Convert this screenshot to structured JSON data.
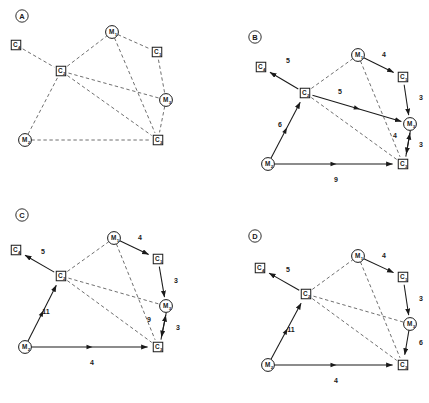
{
  "figure": {
    "caption": "",
    "width": 429,
    "height": 403,
    "colors": {
      "ink": "#1a1a1a",
      "background": "#ffffff",
      "dashed_edge": "#4a4a4a",
      "solid_edge": "#1a1a1a"
    },
    "legend_shapes": {
      "square": "C nodes drawn as squares",
      "circle": "M nodes drawn as circles"
    }
  },
  "panels": [
    {
      "id": "A",
      "letter": "A",
      "letter_pos": {
        "x": 22,
        "y": 16
      },
      "origin": {
        "x": 0,
        "y": 0
      },
      "nodes": [
        {
          "id": "C4",
          "label": "C",
          "sub": "4",
          "shape": "square",
          "x": 16,
          "y": 45
        },
        {
          "id": "C2",
          "label": "C",
          "sub": "2",
          "shape": "square",
          "x": 61,
          "y": 71
        },
        {
          "id": "M1",
          "label": "M",
          "sub": "1",
          "shape": "circle",
          "x": 112,
          "y": 32
        },
        {
          "id": "C1",
          "label": "C",
          "sub": "1",
          "shape": "square",
          "x": 157,
          "y": 52
        },
        {
          "id": "M3",
          "label": "M",
          "sub": "3",
          "shape": "circle",
          "x": 166,
          "y": 100
        },
        {
          "id": "C3",
          "label": "C",
          "sub": "3",
          "shape": "square",
          "x": 158,
          "y": 140
        },
        {
          "id": "M2",
          "label": "M",
          "sub": "2",
          "shape": "circle",
          "x": 25,
          "y": 140
        }
      ],
      "edges": [
        {
          "from": "C4",
          "to": "C2",
          "style": "dashed",
          "arrow": false,
          "weight": null
        },
        {
          "from": "C2",
          "to": "M1",
          "style": "dashed",
          "arrow": false,
          "weight": null
        },
        {
          "from": "M1",
          "to": "C1",
          "style": "dashed",
          "arrow": false,
          "weight": null
        },
        {
          "from": "C1",
          "to": "M3",
          "style": "dashed",
          "arrow": false,
          "weight": null
        },
        {
          "from": "C2",
          "to": "M3",
          "style": "dashed",
          "arrow": false,
          "weight": null
        },
        {
          "from": "C2",
          "to": "C3",
          "style": "dashed",
          "arrow": false,
          "weight": null
        },
        {
          "from": "M1",
          "to": "C3",
          "style": "dashed",
          "arrow": false,
          "weight": null
        },
        {
          "from": "M3",
          "to": "C3",
          "style": "dashed",
          "arrow": false,
          "weight": null
        },
        {
          "from": "C2",
          "to": "M2",
          "style": "dashed",
          "arrow": false,
          "weight": null
        },
        {
          "from": "M2",
          "to": "C3",
          "style": "dashed",
          "arrow": false,
          "weight": null
        }
      ],
      "weight_labels": []
    },
    {
      "id": "B",
      "letter": "B",
      "letter_pos": {
        "x": 255,
        "y": 37
      },
      "origin": {
        "x": 215,
        "y": 0
      },
      "nodes": [
        {
          "id": "C4",
          "label": "C",
          "sub": "4",
          "shape": "square",
          "x": 261,
          "y": 67
        },
        {
          "id": "C2",
          "label": "C",
          "sub": "2",
          "shape": "square",
          "x": 305,
          "y": 93
        },
        {
          "id": "M1",
          "label": "M",
          "sub": "1",
          "shape": "circle",
          "x": 358,
          "y": 55
        },
        {
          "id": "C1",
          "label": "C",
          "sub": "1",
          "shape": "square",
          "x": 403,
          "y": 77
        },
        {
          "id": "M3",
          "label": "M",
          "sub": "3",
          "shape": "circle",
          "x": 410,
          "y": 124
        },
        {
          "id": "C3",
          "label": "C",
          "sub": "3",
          "shape": "square",
          "x": 403,
          "y": 164
        },
        {
          "id": "M2",
          "label": "M",
          "sub": "2",
          "shape": "circle",
          "x": 268,
          "y": 164
        }
      ],
      "edges": [
        {
          "from": "C2",
          "to": "C4",
          "style": "solid",
          "arrow": true,
          "weight": "5"
        },
        {
          "from": "C2",
          "to": "M1",
          "style": "dashed",
          "arrow": false,
          "weight": null
        },
        {
          "from": "M1",
          "to": "C1",
          "style": "solid",
          "arrow": true,
          "weight": "4"
        },
        {
          "from": "C1",
          "to": "M3",
          "style": "solid",
          "arrow": true,
          "weight": "3"
        },
        {
          "from": "C2",
          "to": "M3",
          "style": "solid",
          "arrow": true,
          "weight": "5"
        },
        {
          "from": "C2",
          "to": "C3",
          "style": "dashed",
          "arrow": false,
          "weight": null
        },
        {
          "from": "M1",
          "to": "C3",
          "style": "dashed",
          "arrow": false,
          "weight": null
        },
        {
          "from": "M3",
          "to": "C3",
          "style": "solid",
          "arrow": true,
          "weight": "3"
        },
        {
          "from": "C3",
          "to": "M3",
          "style": "solid",
          "arrow": true,
          "weight": "4"
        },
        {
          "from": "M2",
          "to": "C2",
          "style": "solid",
          "arrow": true,
          "weight": "6"
        },
        {
          "from": "M2",
          "to": "C3",
          "style": "solid",
          "arrow": true,
          "weight": "9"
        }
      ],
      "weight_labels": [
        {
          "text": "5",
          "x": 288,
          "y": 63
        },
        {
          "text": "4",
          "x": 384,
          "y": 57
        },
        {
          "text": "3",
          "x": 421,
          "y": 100
        },
        {
          "text": "5",
          "x": 340,
          "y": 94
        },
        {
          "text": "4",
          "x": 395,
          "y": 138
        },
        {
          "text": "3",
          "x": 421,
          "y": 147
        },
        {
          "text": "6",
          "x": 280,
          "y": 127
        },
        {
          "text": "9",
          "x": 336,
          "y": 182
        }
      ]
    },
    {
      "id": "C",
      "letter": "C",
      "letter_pos": {
        "x": 22,
        "y": 215
      },
      "origin": {
        "x": 0,
        "y": 200
      },
      "nodes": [
        {
          "id": "C4",
          "label": "C",
          "sub": "4",
          "shape": "square",
          "x": 16,
          "y": 250
        },
        {
          "id": "C2",
          "label": "C",
          "sub": "2",
          "shape": "square",
          "x": 61,
          "y": 276
        },
        {
          "id": "M1",
          "label": "M",
          "sub": "1",
          "shape": "circle",
          "x": 114,
          "y": 238
        },
        {
          "id": "C1",
          "label": "C",
          "sub": "1",
          "shape": "square",
          "x": 158,
          "y": 259
        },
        {
          "id": "M3",
          "label": "M",
          "sub": "3",
          "shape": "circle",
          "x": 166,
          "y": 306
        },
        {
          "id": "C3",
          "label": "C",
          "sub": "3",
          "shape": "square",
          "x": 158,
          "y": 347
        },
        {
          "id": "M2",
          "label": "M",
          "sub": "2",
          "shape": "circle",
          "x": 25,
          "y": 347
        }
      ],
      "edges": [
        {
          "from": "C2",
          "to": "C4",
          "style": "solid",
          "arrow": true,
          "weight": "5"
        },
        {
          "from": "C2",
          "to": "M1",
          "style": "dashed",
          "arrow": false,
          "weight": null
        },
        {
          "from": "M1",
          "to": "C1",
          "style": "solid",
          "arrow": true,
          "weight": "4"
        },
        {
          "from": "C1",
          "to": "M3",
          "style": "solid",
          "arrow": true,
          "weight": "3"
        },
        {
          "from": "C2",
          "to": "M3",
          "style": "dashed",
          "arrow": false,
          "weight": null
        },
        {
          "from": "C2",
          "to": "C3",
          "style": "dashed",
          "arrow": false,
          "weight": null
        },
        {
          "from": "M1",
          "to": "C3",
          "style": "dashed",
          "arrow": false,
          "weight": null
        },
        {
          "from": "M3",
          "to": "C3",
          "style": "solid",
          "arrow": true,
          "weight": "3"
        },
        {
          "from": "C3",
          "to": "M3",
          "style": "solid",
          "arrow": true,
          "weight": "9"
        },
        {
          "from": "M2",
          "to": "C2",
          "style": "solid",
          "arrow": true,
          "weight": "11"
        },
        {
          "from": "M2",
          "to": "C3",
          "style": "solid",
          "arrow": true,
          "weight": "4"
        }
      ],
      "weight_labels": [
        {
          "text": "5",
          "x": 43,
          "y": 254
        },
        {
          "text": "4",
          "x": 140,
          "y": 240
        },
        {
          "text": "3",
          "x": 176,
          "y": 283
        },
        {
          "text": "9",
          "x": 149,
          "y": 322
        },
        {
          "text": "3",
          "x": 178,
          "y": 330
        },
        {
          "text": "11",
          "x": 46,
          "y": 314
        },
        {
          "text": "4",
          "x": 92,
          "y": 365
        }
      ]
    },
    {
      "id": "D",
      "letter": "D",
      "letter_pos": {
        "x": 255,
        "y": 236
      },
      "origin": {
        "x": 215,
        "y": 200
      },
      "nodes": [
        {
          "id": "C4",
          "label": "C",
          "sub": "4",
          "shape": "square",
          "x": 260,
          "y": 268
        },
        {
          "id": "C2",
          "label": "C",
          "sub": "2",
          "shape": "square",
          "x": 306,
          "y": 294
        },
        {
          "id": "M1",
          "label": "M",
          "sub": "1",
          "shape": "circle",
          "x": 358,
          "y": 256
        },
        {
          "id": "C1",
          "label": "C",
          "sub": "1",
          "shape": "square",
          "x": 403,
          "y": 277
        },
        {
          "id": "M3",
          "label": "M",
          "sub": "3",
          "shape": "circle",
          "x": 410,
          "y": 324
        },
        {
          "id": "C3",
          "label": "C",
          "sub": "3",
          "shape": "square",
          "x": 403,
          "y": 365
        },
        {
          "id": "M2",
          "label": "M",
          "sub": "2",
          "shape": "circle",
          "x": 268,
          "y": 365
        }
      ],
      "edges": [
        {
          "from": "C2",
          "to": "C4",
          "style": "solid",
          "arrow": true,
          "weight": "5"
        },
        {
          "from": "C2",
          "to": "M1",
          "style": "dashed",
          "arrow": false,
          "weight": null
        },
        {
          "from": "M1",
          "to": "C1",
          "style": "solid",
          "arrow": true,
          "weight": "4"
        },
        {
          "from": "C1",
          "to": "M3",
          "style": "solid",
          "arrow": true,
          "weight": "3"
        },
        {
          "from": "C2",
          "to": "M3",
          "style": "dashed",
          "arrow": false,
          "weight": null
        },
        {
          "from": "C2",
          "to": "C3",
          "style": "dashed",
          "arrow": false,
          "weight": null
        },
        {
          "from": "M1",
          "to": "C3",
          "style": "dashed",
          "arrow": false,
          "weight": null
        },
        {
          "from": "M3",
          "to": "C3",
          "style": "solid",
          "arrow": true,
          "weight": "6"
        },
        {
          "from": "M2",
          "to": "C2",
          "style": "solid",
          "arrow": true,
          "weight": "11"
        },
        {
          "from": "M2",
          "to": "C3",
          "style": "solid",
          "arrow": true,
          "weight": "4"
        }
      ],
      "weight_labels": [
        {
          "text": "5",
          "x": 288,
          "y": 272
        },
        {
          "text": "4",
          "x": 384,
          "y": 258
        },
        {
          "text": "3",
          "x": 421,
          "y": 301
        },
        {
          "text": "6",
          "x": 421,
          "y": 345
        },
        {
          "text": "11",
          "x": 291,
          "y": 332
        },
        {
          "text": "4",
          "x": 336,
          "y": 383
        }
      ]
    }
  ]
}
